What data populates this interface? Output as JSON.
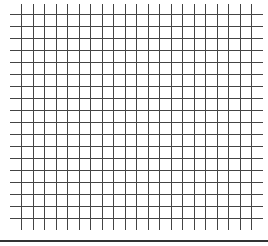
{
  "grid": {
    "line_color": "#444444",
    "vertical_lines": {
      "count": 21,
      "x_start": 21,
      "spacing": 11.5,
      "y_top": 4,
      "y_bottom": 230
    },
    "horizontal_lines": {
      "count": 18,
      "y_start": 14,
      "spacing": 12,
      "x_left": 10,
      "x_right": 263
    }
  },
  "bottom_rule": {
    "color": "#333333"
  }
}
